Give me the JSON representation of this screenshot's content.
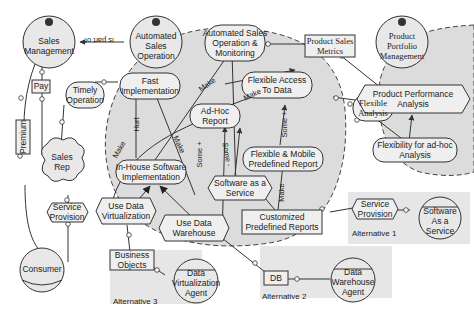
{
  "diagram": {
    "type": "i* strategic rationale model",
    "colors": {
      "boundary_fill": "#dcdcdc",
      "alt_fill": "#e6e6e6",
      "stroke": "#333333"
    },
    "actors": {
      "sales_management": "Sales\nManagement",
      "automated_sales_operation": "Automated\nSales\nOperation",
      "product_portfolio_management": "Product\nPortfolio\nManagement",
      "sales_rep": "Sales\nRep",
      "consumer": "Consumer",
      "software_as_a_service_agent": "Software\nAs a\nService",
      "data_virtualization_agent": "Data\nVirtualization\nAgent",
      "data_warehouse_agent": "Data\nWarehouse\nAgent"
    },
    "goals": {
      "automated_sales_operation_monitoring": "Automated Sales\nOperation &\nMonitoring",
      "fast_implementation": "Fast\nImplementation",
      "timely_operation": "Timely\nOperation",
      "flexible_access_to_data": "Flexible Access\nTo Data",
      "ad_hoc_report": "Ad-Hoc\nReport",
      "flexible_mobile_predefined_report": "Flexible & Mobile\nPredefined Report",
      "flexible_analysis": "Flexible\nAnalysis",
      "flexibility_for_ad_hoc_analysis": "Flexibility for ad-hoc\nAnalysis",
      "in_house_software_implementation": "In-House Software\nImplementation"
    },
    "tasks": {
      "product_performance_analysis": "Product Performance\nAnalysis",
      "software_as_a_service": "Software as a\nService",
      "use_data_virtualization": "Use Data\nVirtualization",
      "use_data_warehouse": "Use Data\nWarehouse",
      "service_provision_left": "Service\nProvision",
      "service_provision_alt1": "Service\nProvision"
    },
    "resources": {
      "product_sales_metrics": "Product Sales\nMetrics",
      "pay": "Pay",
      "premium": "Premium",
      "customized_predefined_reports": "Customized\nPredefined Reports",
      "business_objects": "Business\nObjects",
      "db": "DB"
    },
    "edge_labels": {
      "is_part_of": "is part of",
      "make1": "Make",
      "make2": "Make",
      "make3": "Make",
      "make4": "Make",
      "hurt": "Hurt",
      "some_plus1": "Some +",
      "some_plus2": "Some +",
      "some_minus": "Some -"
    },
    "alternatives": {
      "alt1": "Alternative 1",
      "alt2": "Alternative 2",
      "alt3": "Alternative 3"
    }
  }
}
